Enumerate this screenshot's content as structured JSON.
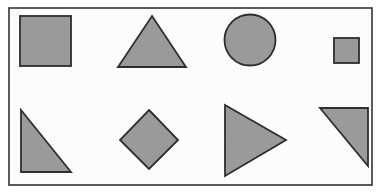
{
  "figure": {
    "width": 382,
    "height": 196,
    "background_color": "#fcfcfc",
    "page_color": "#ffffff"
  },
  "frame": {
    "name": "outer-border",
    "x": 9,
    "y": 8,
    "width": 363,
    "height": 177,
    "stroke_color": "#333333",
    "stroke_width": 1.6,
    "fill_color": "#fcfcfc"
  },
  "style": {
    "shape_fill": "#9a9a9a",
    "shape_stroke": "#2e2e2e",
    "shape_stroke_width": 1.8
  },
  "chart_data": {
    "type": "diagram",
    "rows": 2,
    "columns": 4,
    "shape_count": 8,
    "shapes": [
      {
        "index": 0,
        "name": "square-large",
        "label": "Square",
        "row": 1,
        "column": 1,
        "geometry": "rect",
        "x": 20,
        "y": 16,
        "width": 51,
        "height": 50,
        "center": [
          45.5,
          41
        ],
        "fill": "#9a9a9a",
        "stroke": "#2e2e2e"
      },
      {
        "index": 1,
        "name": "triangle-up",
        "label": "Triangle (pointing up)",
        "row": 1,
        "column": 2,
        "geometry": "polygon",
        "points": [
          [
            152,
            16
          ],
          [
            186,
            67
          ],
          [
            118,
            67
          ]
        ],
        "center": [
          152,
          50
        ],
        "fill": "#9a9a9a",
        "stroke": "#2e2e2e"
      },
      {
        "index": 2,
        "name": "circle",
        "label": "Circle",
        "row": 1,
        "column": 3,
        "geometry": "ellipse",
        "cx": 250,
        "cy": 40,
        "rx": 25.5,
        "ry": 25.5,
        "fill": "#9a9a9a",
        "stroke": "#2e2e2e"
      },
      {
        "index": 3,
        "name": "square-small",
        "label": "Small square",
        "row": 1,
        "column": 4,
        "geometry": "rect",
        "x": 334,
        "y": 38,
        "width": 25,
        "height": 25,
        "center": [
          346.5,
          50.5
        ],
        "fill": "#9a9a9a",
        "stroke": "#2e2e2e"
      },
      {
        "index": 4,
        "name": "right-triangle-lower-left",
        "label": "Right triangle (right angle bottom-left)",
        "row": 2,
        "column": 1,
        "geometry": "polygon",
        "points": [
          [
            21,
            110
          ],
          [
            21,
            172
          ],
          [
            71,
            172
          ]
        ],
        "center": [
          37.7,
          151.3
        ],
        "fill": "#9a9a9a",
        "stroke": "#2e2e2e"
      },
      {
        "index": 5,
        "name": "diamond",
        "label": "Diamond (rotated square)",
        "row": 2,
        "column": 2,
        "geometry": "polygon",
        "points": [
          [
            149,
            110
          ],
          [
            178,
            140
          ],
          [
            149,
            169
          ],
          [
            120,
            140
          ]
        ],
        "center": [
          149,
          140
        ],
        "fill": "#9a9a9a",
        "stroke": "#2e2e2e"
      },
      {
        "index": 6,
        "name": "triangle-right",
        "label": "Triangle (pointing right)",
        "row": 2,
        "column": 3,
        "geometry": "polygon",
        "points": [
          [
            225,
            105
          ],
          [
            286,
            140
          ],
          [
            225,
            176
          ]
        ],
        "center": [
          245.3,
          140.3
        ],
        "fill": "#9a9a9a",
        "stroke": "#2e2e2e"
      },
      {
        "index": 7,
        "name": "right-triangle-upper-right",
        "label": "Right triangle (right angle top-right)",
        "row": 2,
        "column": 4,
        "geometry": "polygon",
        "points": [
          [
            320,
            108
          ],
          [
            368,
            108
          ],
          [
            368,
            166
          ]
        ],
        "center": [
          352,
          127.3
        ],
        "fill": "#9a9a9a",
        "stroke": "#2e2e2e"
      }
    ]
  }
}
